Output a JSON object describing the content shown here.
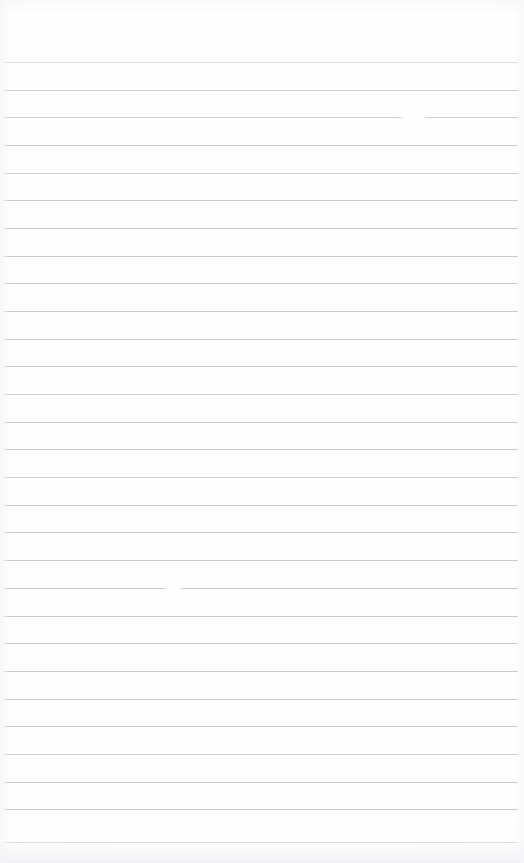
{
  "document": {
    "kind": "lined-paper-scan",
    "title": "Blank Ruled Notebook Page",
    "description": "Scanned blank sheet of ruled writing paper. No handwriting, printed text, headings, page numbers or annotations are present.",
    "page_width": 524,
    "page_height": 863,
    "background_color": "#ffffff",
    "has_text_content": false,
    "has_margin_rule": false,
    "has_holes": false,
    "orientation": "portrait"
  },
  "ruling": {
    "line_color": "#c5c9cf",
    "line_thickness": 1,
    "line_count": 29,
    "line_spacing": 27.7,
    "first_line_y": 62,
    "last_line_y": 842,
    "line_start_x": 4,
    "line_end_x": 518,
    "top_margin": 62,
    "positions": [
      62,
      90,
      117,
      145,
      173,
      200,
      228,
      256,
      283,
      311,
      339,
      366,
      394,
      422,
      449,
      477,
      505,
      532,
      560,
      588,
      616,
      643,
      671,
      699,
      726,
      754,
      782,
      809,
      842
    ],
    "faint_line_indices": [
      0,
      28
    ]
  },
  "scan_artifacts": {
    "defects": [
      {
        "name": "line-break-upper-right",
        "x": 398,
        "y": 117,
        "width": 30
      },
      {
        "name": "line-break-mid-left",
        "x": 163,
        "y": 588,
        "width": 20
      }
    ],
    "bottom_edge_shading": true,
    "top_edge_shading": true,
    "left_edge_shading": true,
    "right_edge_shading": true,
    "paper_grain": true
  },
  "content": {
    "text_lines": [],
    "empty_notice": ""
  }
}
